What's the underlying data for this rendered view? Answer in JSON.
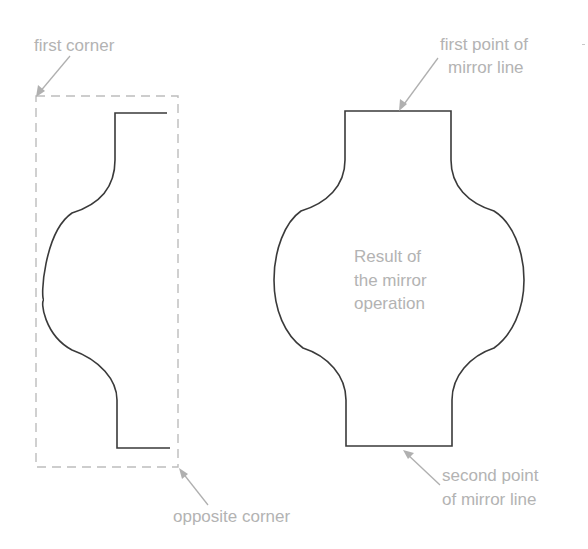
{
  "diagram": {
    "labels": {
      "first_corner": "first corner",
      "opposite_corner": "opposite corner",
      "first_point_line1": "first point of",
      "first_point_line2": "mirror line",
      "second_point_line1": "second point",
      "second_point_line2": "of mirror line",
      "result_line1": "Result of",
      "result_line2": "the mirror",
      "result_line3": "operation"
    },
    "colors": {
      "background": "#ffffff",
      "shape_stroke": "#3a3a3a",
      "selection_box_stroke": "#bdbdbd",
      "annotation_text": "#b3b3b3",
      "leader_arrow": "#b0b0b0"
    },
    "elements": {
      "selection_window": {
        "style": "dashed rectangle",
        "corners": [
          "first corner",
          "opposite corner"
        ]
      },
      "original_half_profile": {
        "style": "solid polyline with arcs"
      },
      "mirrored_result": {
        "style": "solid closed profile"
      },
      "mirror_line_points": [
        "first point of mirror line",
        "second point of mirror line"
      ]
    }
  }
}
